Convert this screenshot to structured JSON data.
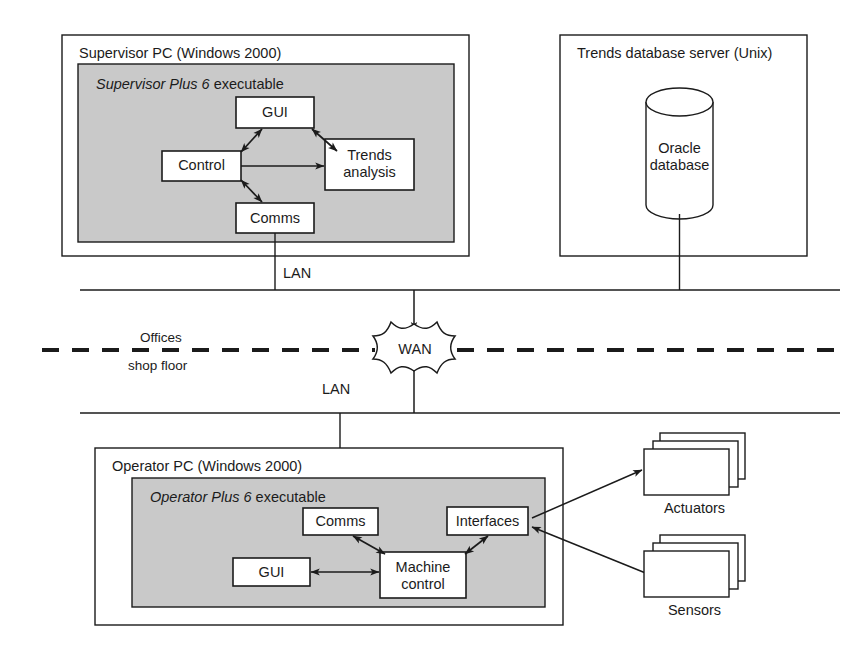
{
  "diagram": {
    "colors": {
      "stroke": "#1b1b1b",
      "fill_gray": "#c9c9c9",
      "fill_white": "#ffffff",
      "background": "#ffffff"
    },
    "zones": [
      {
        "id": "supervisor-pc",
        "title": "Supervisor PC (Windows 2000)",
        "executable": {
          "italic": "Supervisor Plus 6",
          "rest": " executable"
        },
        "nodes": [
          {
            "id": "gui",
            "label": "GUI"
          },
          {
            "id": "control",
            "label": "Control"
          },
          {
            "id": "trends-analysis",
            "label": "Trends\nanalysis",
            "line1": "Trends",
            "line2": "analysis"
          },
          {
            "id": "comms",
            "label": "Comms"
          }
        ]
      },
      {
        "id": "trends-database-server",
        "title": "Trends database server (Unix)",
        "nodes": [
          {
            "id": "oracle-database",
            "line1": "Oracle",
            "line2": "database"
          }
        ]
      },
      {
        "id": "operator-pc",
        "title": "Operator PC (Windows 2000)",
        "executable": {
          "italic": "Operator Plus 6",
          "rest": " executable"
        },
        "nodes": [
          {
            "id": "comms",
            "label": "Comms"
          },
          {
            "id": "interfaces",
            "label": "Interfaces"
          },
          {
            "id": "gui",
            "label": "GUI"
          },
          {
            "id": "machine-control",
            "label": "Machine control",
            "line1": "Machine",
            "line2": "control"
          }
        ]
      }
    ],
    "network": {
      "lan_top_label": "LAN",
      "lan_bottom_label": "LAN",
      "wan_label": "WAN",
      "boundary_upper": "Offices",
      "boundary_lower": "shop floor"
    },
    "field_devices": [
      {
        "id": "actuators",
        "label": "Actuators"
      },
      {
        "id": "sensors",
        "label": "Sensors"
      }
    ]
  }
}
